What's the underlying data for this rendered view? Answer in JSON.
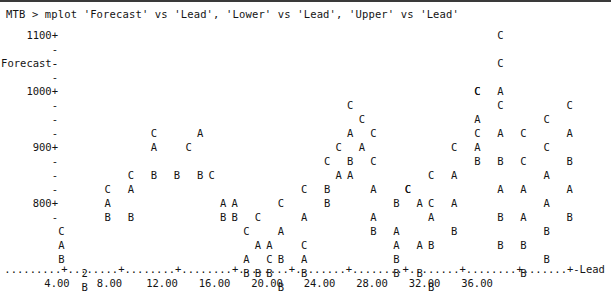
{
  "terminal": {
    "prompt": "MTB > ",
    "command": "mplot 'Forecast' vs 'Lead', 'Lower' vs 'Lead', 'Upper' vs 'Lead'",
    "command_line": "MTB > mplot 'Forecast' vs 'Lead', 'Lower' vs 'Lead', 'Upper' vs 'Lead'"
  },
  "chart_data": {
    "type": "scatter",
    "title": "",
    "xlabel": "Lead",
    "ylabel": "Forecast",
    "xlim": [
      0,
      38
    ],
    "ylim": [
      780,
      1140
    ],
    "grid": false,
    "legend": "none",
    "axis_style": "character-mode",
    "xticks": [
      "4.00",
      "8.00",
      "12.00",
      "16.00",
      "20.00",
      "24.00",
      "28.00",
      "32.00",
      "36.00"
    ],
    "xtick_values": [
      4,
      8,
      12,
      16,
      20,
      24,
      28,
      32,
      36
    ],
    "yticks": [
      "1100+",
      "-",
      "-",
      "-",
      "1000+",
      "-",
      "-",
      "-",
      "900+",
      "-",
      "-",
      "-",
      "800+",
      "-"
    ],
    "ytick_labeled": [
      "1100",
      "1000",
      "900",
      "800"
    ],
    "y_axis_title_row": "Forecast-",
    "x_axis_end_label": "Lead",
    "series": [
      {
        "name": "Forecast",
        "symbol": "A"
      },
      {
        "name": "Lower",
        "symbol": "B"
      },
      {
        "name": "Upper",
        "symbol": "C"
      }
    ],
    "overlap_symbol": "2",
    "overlap_note": "2 indicates two points plotted at the same character cell",
    "points": [
      {
        "col": 0,
        "row": 14,
        "sym": "C"
      },
      {
        "col": 0,
        "row": 15,
        "sym": "A"
      },
      {
        "col": 0,
        "row": 16,
        "sym": "B"
      },
      {
        "col": 2,
        "row": 17,
        "sym": "2"
      },
      {
        "col": 2,
        "row": 18,
        "sym": "B"
      },
      {
        "col": 4,
        "row": 11,
        "sym": "C"
      },
      {
        "col": 4,
        "row": 12,
        "sym": "A"
      },
      {
        "col": 4,
        "row": 13,
        "sym": "B"
      },
      {
        "col": 6,
        "row": 10,
        "sym": "C"
      },
      {
        "col": 6,
        "row": 11,
        "sym": "A"
      },
      {
        "col": 6,
        "row": 13,
        "sym": "B"
      },
      {
        "col": 8,
        "row": 7,
        "sym": "C"
      },
      {
        "col": 8,
        "row": 8,
        "sym": "A"
      },
      {
        "col": 8,
        "row": 10,
        "sym": "B"
      },
      {
        "col": 10,
        "row": 10,
        "sym": "B"
      },
      {
        "col": 11,
        "row": 8,
        "sym": "C"
      },
      {
        "col": 12,
        "row": 7,
        "sym": "A"
      },
      {
        "col": 12,
        "row": 10,
        "sym": "B"
      },
      {
        "col": 13,
        "row": 10,
        "sym": "C"
      },
      {
        "col": 14,
        "row": 12,
        "sym": "A"
      },
      {
        "col": 14,
        "row": 13,
        "sym": "B"
      },
      {
        "col": 15,
        "row": 12,
        "sym": "A"
      },
      {
        "col": 15,
        "row": 13,
        "sym": "B"
      },
      {
        "col": 16,
        "row": 14,
        "sym": "C"
      },
      {
        "col": 16,
        "row": 16,
        "sym": "A"
      },
      {
        "col": 16,
        "row": 17,
        "sym": "B"
      },
      {
        "col": 17,
        "row": 13,
        "sym": "C"
      },
      {
        "col": 17,
        "row": 15,
        "sym": "A"
      },
      {
        "col": 17,
        "row": 17,
        "sym": "B"
      },
      {
        "col": 18,
        "row": 15,
        "sym": "A"
      },
      {
        "col": 18,
        "row": 16,
        "sym": "C"
      },
      {
        "col": 18,
        "row": 17,
        "sym": "B"
      },
      {
        "col": 19,
        "row": 12,
        "sym": "C"
      },
      {
        "col": 19,
        "row": 14,
        "sym": "A"
      },
      {
        "col": 19,
        "row": 16,
        "sym": "B"
      },
      {
        "col": 19,
        "row": 18,
        "sym": "B"
      },
      {
        "col": 21,
        "row": 11,
        "sym": "C"
      },
      {
        "col": 21,
        "row": 13,
        "sym": "A"
      },
      {
        "col": 21,
        "row": 15,
        "sym": "C"
      },
      {
        "col": 21,
        "row": 16,
        "sym": "A"
      },
      {
        "col": 21,
        "row": 17,
        "sym": "B"
      },
      {
        "col": 23,
        "row": 9,
        "sym": "C"
      },
      {
        "col": 23,
        "row": 11,
        "sym": "B"
      },
      {
        "col": 23,
        "row": 12,
        "sym": "B"
      },
      {
        "col": 24,
        "row": 8,
        "sym": "C"
      },
      {
        "col": 24,
        "row": 10,
        "sym": "A"
      },
      {
        "col": 25,
        "row": 5,
        "sym": "C"
      },
      {
        "col": 25,
        "row": 7,
        "sym": "A"
      },
      {
        "col": 25,
        "row": 9,
        "sym": "B"
      },
      {
        "col": 25,
        "row": 10,
        "sym": "A"
      },
      {
        "col": 26,
        "row": 6,
        "sym": "C"
      },
      {
        "col": 26,
        "row": 8,
        "sym": "A"
      },
      {
        "col": 27,
        "row": 7,
        "sym": "C"
      },
      {
        "col": 27,
        "row": 9,
        "sym": "C"
      },
      {
        "col": 27,
        "row": 11,
        "sym": "A"
      },
      {
        "col": 27,
        "row": 13,
        "sym": "A"
      },
      {
        "col": 27,
        "row": 14,
        "sym": "B"
      },
      {
        "col": 29,
        "row": 12,
        "sym": "B"
      },
      {
        "col": 29,
        "row": 14,
        "sym": "A"
      },
      {
        "col": 29,
        "row": 15,
        "sym": "A"
      },
      {
        "col": 29,
        "row": 16,
        "sym": "B"
      },
      {
        "col": 29,
        "row": 17,
        "sym": "B"
      },
      {
        "col": 30,
        "row": 11,
        "sym": "C"
      },
      {
        "col": 30,
        "row": 11,
        "sym": "C"
      },
      {
        "col": 31,
        "row": 12,
        "sym": "A"
      },
      {
        "col": 31,
        "row": 15,
        "sym": "A"
      },
      {
        "col": 31,
        "row": 17,
        "sym": "B"
      },
      {
        "col": 32,
        "row": 10,
        "sym": "C"
      },
      {
        "col": 32,
        "row": 12,
        "sym": "C"
      },
      {
        "col": 32,
        "row": 13,
        "sym": "A"
      },
      {
        "col": 32,
        "row": 15,
        "sym": "B"
      },
      {
        "col": 32,
        "row": 18,
        "sym": "B"
      },
      {
        "col": 34,
        "row": 8,
        "sym": "C"
      },
      {
        "col": 34,
        "row": 10,
        "sym": "A"
      },
      {
        "col": 34,
        "row": 12,
        "sym": "A"
      },
      {
        "col": 34,
        "row": 14,
        "sym": "B"
      },
      {
        "col": 36,
        "row": 4,
        "sym": "C"
      },
      {
        "col": 36,
        "row": 4,
        "sym": "C"
      },
      {
        "col": 36,
        "row": 6,
        "sym": "A"
      },
      {
        "col": 36,
        "row": 7,
        "sym": "C"
      },
      {
        "col": 36,
        "row": 8,
        "sym": "A"
      },
      {
        "col": 36,
        "row": 9,
        "sym": "B"
      },
      {
        "col": 38,
        "row": 0,
        "sym": "C"
      },
      {
        "col": 38,
        "row": 2,
        "sym": "C"
      },
      {
        "col": 38,
        "row": 4,
        "sym": "A"
      },
      {
        "col": 38,
        "row": 5,
        "sym": "C"
      },
      {
        "col": 38,
        "row": 7,
        "sym": "A"
      },
      {
        "col": 38,
        "row": 9,
        "sym": "B"
      },
      {
        "col": 38,
        "row": 11,
        "sym": "A"
      },
      {
        "col": 38,
        "row": 13,
        "sym": "B"
      },
      {
        "col": 38,
        "row": 15,
        "sym": "B"
      },
      {
        "col": 40,
        "row": 7,
        "sym": "C"
      },
      {
        "col": 40,
        "row": 9,
        "sym": "C"
      },
      {
        "col": 40,
        "row": 11,
        "sym": "A"
      },
      {
        "col": 40,
        "row": 13,
        "sym": "A"
      },
      {
        "col": 40,
        "row": 15,
        "sym": "B"
      },
      {
        "col": 40,
        "row": 17,
        "sym": "B"
      },
      {
        "col": 42,
        "row": 6,
        "sym": "C"
      },
      {
        "col": 42,
        "row": 8,
        "sym": "C"
      },
      {
        "col": 42,
        "row": 10,
        "sym": "A"
      },
      {
        "col": 42,
        "row": 12,
        "sym": "A"
      },
      {
        "col": 42,
        "row": 14,
        "sym": "B"
      },
      {
        "col": 42,
        "row": 16,
        "sym": "B"
      },
      {
        "col": 44,
        "row": 5,
        "sym": "C"
      },
      {
        "col": 44,
        "row": 7,
        "sym": "A"
      },
      {
        "col": 44,
        "row": 9,
        "sym": "B"
      },
      {
        "col": 44,
        "row": 11,
        "sym": "A"
      },
      {
        "col": 44,
        "row": 13,
        "sym": "B"
      }
    ]
  }
}
